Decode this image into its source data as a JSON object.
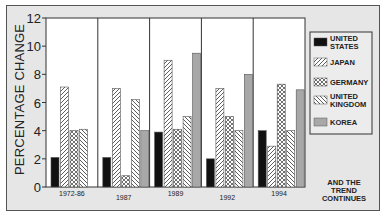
{
  "chart_data": {
    "type": "bar",
    "title": "",
    "xlabel": "",
    "ylabel": "PERCENTAGE CHANGE",
    "ylim": [
      0,
      12
    ],
    "yticks": [
      0,
      2,
      4,
      6,
      8,
      10,
      12
    ],
    "grid": false,
    "legend_position": "right",
    "categories": [
      "1972-86",
      "1987",
      "1989",
      "1992",
      "1994"
    ],
    "series": [
      {
        "name": "UNITED STATES",
        "pattern": "solid-black",
        "values": [
          2.1,
          2.1,
          3.9,
          2.0,
          4.0
        ]
      },
      {
        "name": "JAPAN",
        "pattern": "diagonal-hatch",
        "values": [
          7.1,
          7.0,
          9.0,
          7.0,
          2.9
        ]
      },
      {
        "name": "GERMANY",
        "pattern": "crosshatch",
        "values": [
          4.0,
          0.8,
          4.1,
          5.0,
          7.3
        ]
      },
      {
        "name": "UNITED KINGDOM",
        "pattern": "back-diagonal-hatch",
        "values": [
          4.1,
          6.2,
          5.0,
          4.0,
          4.0
        ]
      },
      {
        "name": "KOREA",
        "pattern": "solid-gray",
        "values": [
          null,
          4.0,
          9.5,
          8.0,
          6.9
        ]
      }
    ],
    "annotations": [
      "AND THE TREND CONTINUES"
    ]
  },
  "legend": {
    "items": [
      {
        "line1": "UNITED",
        "line2": "STATES"
      },
      {
        "line1": "JAPAN",
        "line2": ""
      },
      {
        "line1": "GERMANY",
        "line2": ""
      },
      {
        "line1": "UNITED",
        "line2": "KINGDOM"
      },
      {
        "line1": "KOREA",
        "line2": ""
      }
    ]
  },
  "note": {
    "lines": [
      "AND THE",
      "TREND",
      "CONTINUES"
    ]
  },
  "colors": {
    "black": "#111111",
    "gray": "#a8a8a8",
    "frame_bg": "#e6e6e6",
    "plot_bg": "#ffffff",
    "line": "#333333"
  }
}
